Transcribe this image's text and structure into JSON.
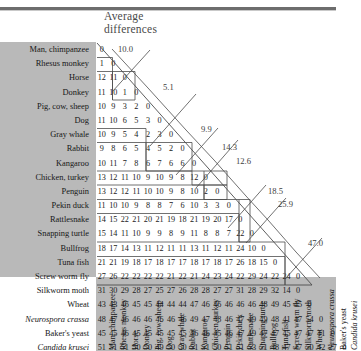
{
  "figure": {
    "title_line1": "Average",
    "title_line2": "differences"
  },
  "chart_data": {
    "type": "table",
    "title": "Average differences",
    "xlabel": "",
    "ylabel": "",
    "grid": true,
    "legend": "none",
    "categories": [
      "Man, chimpanzee",
      "Rhesus monkey",
      "Horse",
      "Donkey",
      "Pig, cow, sheep",
      "Dog",
      "Gray whale",
      "Rabbit",
      "Kangaroo",
      "Chicken, turkey",
      "Penguin",
      "Pekin duck",
      "Rattlesnake",
      "Snapping turtle",
      "Bullfrog",
      "Tuna fish",
      "Screw worm fly",
      "Silkworm moth",
      "Wheat",
      "Neurospora crassa",
      "Baker's yeast",
      "Candida krusei"
    ],
    "italic_categories": [
      "Neurospora crassa",
      "Candida krusei"
    ],
    "rows": [
      {
        "label": "Man, chimpanzee",
        "italic": false,
        "values": [
          0
        ]
      },
      {
        "label": "Rhesus monkey",
        "italic": false,
        "values": [
          1,
          0
        ]
      },
      {
        "label": "Horse",
        "italic": false,
        "values": [
          12,
          11,
          0
        ]
      },
      {
        "label": "Donkey",
        "italic": false,
        "values": [
          11,
          10,
          1,
          0
        ]
      },
      {
        "label": "Pig, cow, sheep",
        "italic": false,
        "values": [
          10,
          9,
          3,
          2,
          0
        ]
      },
      {
        "label": "Dog",
        "italic": false,
        "values": [
          11,
          10,
          6,
          5,
          3,
          0
        ]
      },
      {
        "label": "Gray whale",
        "italic": false,
        "values": [
          10,
          9,
          5,
          4,
          2,
          3,
          0
        ]
      },
      {
        "label": "Rabbit",
        "italic": false,
        "values": [
          9,
          8,
          6,
          5,
          4,
          5,
          2,
          0
        ]
      },
      {
        "label": "Kangaroo",
        "italic": false,
        "values": [
          10,
          11,
          7,
          8,
          6,
          7,
          6,
          6,
          0
        ]
      },
      {
        "label": "Chicken, turkey",
        "italic": false,
        "values": [
          13,
          12,
          11,
          10,
          9,
          10,
          9,
          8,
          12,
          0
        ]
      },
      {
        "label": "Penguin",
        "italic": false,
        "values": [
          13,
          12,
          12,
          11,
          10,
          10,
          9,
          8,
          10,
          2,
          0
        ]
      },
      {
        "label": "Pekin duck",
        "italic": false,
        "values": [
          11,
          10,
          10,
          9,
          8,
          8,
          7,
          6,
          10,
          3,
          3,
          0
        ]
      },
      {
        "label": "Rattlesnake",
        "italic": false,
        "values": [
          14,
          15,
          22,
          21,
          20,
          21,
          19,
          18,
          21,
          19,
          20,
          17,
          0
        ]
      },
      {
        "label": "Snapping turtle",
        "italic": false,
        "values": [
          15,
          14,
          11,
          10,
          9,
          9,
          8,
          9,
          11,
          8,
          8,
          7,
          22,
          0
        ]
      },
      {
        "label": "Bullfrog",
        "italic": false,
        "values": [
          18,
          17,
          14,
          13,
          11,
          12,
          11,
          11,
          13,
          11,
          12,
          11,
          24,
          10,
          0
        ]
      },
      {
        "label": "Tuna fish",
        "italic": false,
        "values": [
          21,
          21,
          19,
          18,
          17,
          18,
          17,
          17,
          18,
          17,
          18,
          17,
          26,
          18,
          15,
          0
        ]
      },
      {
        "label": "Screw worm fly",
        "italic": false,
        "values": [
          27,
          26,
          22,
          22,
          22,
          22,
          21,
          22,
          21,
          24,
          23,
          24,
          22,
          29,
          24,
          22,
          24,
          0
        ]
      },
      {
        "label": "Silkworm moth",
        "italic": false,
        "values": [
          31,
          30,
          29,
          28,
          27,
          25,
          27,
          26,
          28,
          28,
          27,
          27,
          31,
          28,
          29,
          32,
          14,
          0
        ]
      },
      {
        "label": "Wheat",
        "italic": false,
        "values": [
          43,
          43,
          46,
          45,
          45,
          44,
          44,
          44,
          47,
          46,
          46,
          46,
          46,
          46,
          48,
          49,
          45,
          45,
          0
        ]
      },
      {
        "label": "Neurospora crassa",
        "italic": true,
        "values": [
          48,
          47,
          46,
          46,
          46,
          46,
          46,
          46,
          49,
          47,
          48,
          46,
          47,
          49,
          49,
          48,
          41,
          47,
          54,
          0
        ]
      },
      {
        "label": "Baker's yeast",
        "italic": false,
        "values": [
          45,
          45,
          46,
          45,
          45,
          45,
          45,
          45,
          46,
          46,
          45,
          46,
          47,
          49,
          47,
          47,
          45,
          47,
          47,
          41,
          0
        ]
      },
      {
        "label": "Candida krusei",
        "italic": true,
        "values": [
          51,
          51,
          51,
          50,
          50,
          49,
          50,
          50,
          51,
          51,
          50,
          51,
          51,
          53,
          51,
          48,
          47,
          47,
          50,
          42,
          27,
          0
        ]
      }
    ],
    "annotations": [
      {
        "value": "10.0",
        "note": "primates vs other mammals"
      },
      {
        "value": "5.1",
        "note": "within other mammals"
      },
      {
        "value": "9.9",
        "note": "mammals vs birds"
      },
      {
        "value": "14.3",
        "note": "birds/mammals vs rattlesnake"
      },
      {
        "value": "12.6",
        "note": "vs snapping turtle"
      },
      {
        "value": "18.5",
        "note": "vertebrates vs insects"
      },
      {
        "value": "25.9",
        "note": "vs silkworm moth group"
      },
      {
        "value": "47.0",
        "note": "animals vs plants/fungi"
      }
    ]
  }
}
